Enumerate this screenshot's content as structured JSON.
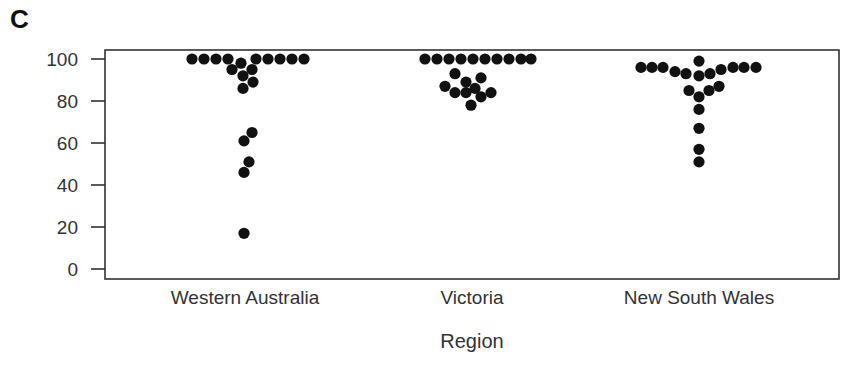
{
  "panel_label": "C",
  "chart_data": {
    "type": "scatter",
    "subtype": "beeswarm",
    "title": "",
    "xlabel": "Region",
    "ylabel": "",
    "ylim": [
      0,
      100
    ],
    "yticks": [
      0,
      20,
      40,
      60,
      80,
      100
    ],
    "categories": [
      "Western Australia",
      "Victoria",
      "New South Wales"
    ],
    "grid": false,
    "legend": null,
    "series": [
      {
        "name": "Western Australia",
        "points": [
          {
            "x": 192,
            "y": 100
          },
          {
            "x": 204,
            "y": 100
          },
          {
            "x": 216,
            "y": 100
          },
          {
            "x": 228,
            "y": 100
          },
          {
            "x": 256,
            "y": 100
          },
          {
            "x": 268,
            "y": 100
          },
          {
            "x": 280,
            "y": 100
          },
          {
            "x": 292,
            "y": 100
          },
          {
            "x": 304,
            "y": 100
          },
          {
            "x": 241,
            "y": 98
          },
          {
            "x": 232,
            "y": 95
          },
          {
            "x": 252,
            "y": 95
          },
          {
            "x": 243,
            "y": 92
          },
          {
            "x": 253,
            "y": 89
          },
          {
            "x": 243,
            "y": 86
          },
          {
            "x": 252,
            "y": 65
          },
          {
            "x": 244,
            "y": 61
          },
          {
            "x": 249,
            "y": 51
          },
          {
            "x": 244,
            "y": 46
          },
          {
            "x": 244,
            "y": 17
          }
        ]
      },
      {
        "name": "Victoria",
        "points": [
          {
            "x": 425,
            "y": 100
          },
          {
            "x": 437,
            "y": 100
          },
          {
            "x": 449,
            "y": 100
          },
          {
            "x": 461,
            "y": 100
          },
          {
            "x": 473,
            "y": 100
          },
          {
            "x": 485,
            "y": 100
          },
          {
            "x": 497,
            "y": 100
          },
          {
            "x": 509,
            "y": 100
          },
          {
            "x": 521,
            "y": 100
          },
          {
            "x": 531,
            "y": 100
          },
          {
            "x": 455,
            "y": 93
          },
          {
            "x": 481,
            "y": 91
          },
          {
            "x": 466,
            "y": 89
          },
          {
            "x": 445,
            "y": 87
          },
          {
            "x": 475,
            "y": 86
          },
          {
            "x": 455,
            "y": 84
          },
          {
            "x": 466,
            "y": 84
          },
          {
            "x": 491,
            "y": 84
          },
          {
            "x": 481,
            "y": 82
          },
          {
            "x": 471,
            "y": 78
          }
        ]
      },
      {
        "name": "New South Wales",
        "points": [
          {
            "x": 699,
            "y": 99
          },
          {
            "x": 641,
            "y": 96
          },
          {
            "x": 652,
            "y": 96
          },
          {
            "x": 663,
            "y": 96
          },
          {
            "x": 675,
            "y": 94
          },
          {
            "x": 686,
            "y": 93
          },
          {
            "x": 699,
            "y": 92
          },
          {
            "x": 710,
            "y": 93
          },
          {
            "x": 721,
            "y": 95
          },
          {
            "x": 733,
            "y": 96
          },
          {
            "x": 744,
            "y": 96
          },
          {
            "x": 756,
            "y": 96
          },
          {
            "x": 689,
            "y": 85
          },
          {
            "x": 709,
            "y": 85
          },
          {
            "x": 719,
            "y": 87
          },
          {
            "x": 699,
            "y": 82
          },
          {
            "x": 699,
            "y": 76
          },
          {
            "x": 699,
            "y": 67
          },
          {
            "x": 699,
            "y": 57
          },
          {
            "x": 699,
            "y": 51
          }
        ]
      }
    ],
    "colors": {
      "dot": "#111111",
      "axis": "#333333",
      "text": "#333333"
    }
  }
}
